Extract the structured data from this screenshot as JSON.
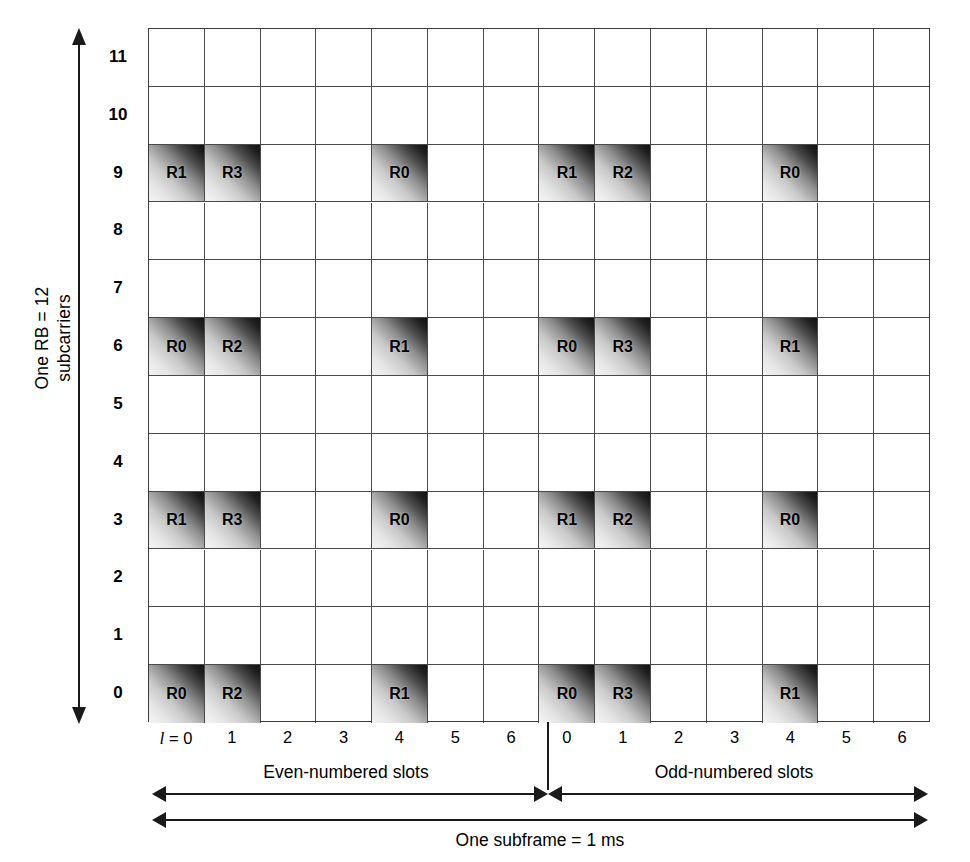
{
  "figure": {
    "y_axis_caption": "One RB = 12\nsubcarriers",
    "row_labels": [
      "11",
      "10",
      "9",
      "8",
      "7",
      "6",
      "5",
      "4",
      "3",
      "2",
      "1",
      "0"
    ],
    "symbol_labels": [
      "l = 0",
      "1",
      "2",
      "3",
      "4",
      "5",
      "6",
      "0",
      "1",
      "2",
      "3",
      "4",
      "5",
      "6"
    ],
    "symbol_label_prefix_var": "l",
    "symbol_label_prefix_rest": " = 0",
    "slot_captions": [
      "Even-numbered slots",
      "Odd-numbered slots"
    ],
    "subframe_caption": "One subframe = 1 ms",
    "colors": {
      "grid_line": "#4a4a4a",
      "grid_border": "#3a3a3a",
      "arrow": "#1a1a1a",
      "rs_light": "#f4f4f4",
      "rs_dark": "#111111",
      "background": "#ffffff"
    }
  },
  "chart_data": {
    "type": "heatmap",
    "title": "",
    "xlabel": "",
    "ylabel": "One RB = 12 subcarriers",
    "grid": true,
    "legend_position": "none",
    "rows": 12,
    "columns": 14,
    "row_labels": [
      "11",
      "10",
      "9",
      "8",
      "7",
      "6",
      "5",
      "4",
      "3",
      "2",
      "1",
      "0"
    ],
    "column_labels": [
      "0",
      "1",
      "2",
      "3",
      "4",
      "5",
      "6",
      "0",
      "1",
      "2",
      "3",
      "4",
      "5",
      "6"
    ],
    "row_order": "top-to-bottom subcarrier 11 down to 0",
    "slot_split_after_column_index": 6,
    "cells": [
      {
        "subcarrier": 11,
        "values": [
          "",
          "",
          "",
          "",
          "",
          "",
          "",
          "",
          "",
          "",
          "",
          "",
          "",
          ""
        ]
      },
      {
        "subcarrier": 10,
        "values": [
          "",
          "",
          "",
          "",
          "",
          "",
          "",
          "",
          "",
          "",
          "",
          "",
          "",
          ""
        ]
      },
      {
        "subcarrier": 9,
        "values": [
          "R1",
          "R3",
          "",
          "",
          "R0",
          "",
          "",
          "R1",
          "R2",
          "",
          "",
          "R0",
          "",
          ""
        ]
      },
      {
        "subcarrier": 8,
        "values": [
          "",
          "",
          "",
          "",
          "",
          "",
          "",
          "",
          "",
          "",
          "",
          "",
          "",
          ""
        ]
      },
      {
        "subcarrier": 7,
        "values": [
          "",
          "",
          "",
          "",
          "",
          "",
          "",
          "",
          "",
          "",
          "",
          "",
          "",
          ""
        ]
      },
      {
        "subcarrier": 6,
        "values": [
          "R0",
          "R2",
          "",
          "",
          "R1",
          "",
          "",
          "R0",
          "R3",
          "",
          "",
          "R1",
          "",
          ""
        ]
      },
      {
        "subcarrier": 5,
        "values": [
          "",
          "",
          "",
          "",
          "",
          "",
          "",
          "",
          "",
          "",
          "",
          "",
          "",
          ""
        ]
      },
      {
        "subcarrier": 4,
        "values": [
          "",
          "",
          "",
          "",
          "",
          "",
          "",
          "",
          "",
          "",
          "",
          "",
          "",
          ""
        ]
      },
      {
        "subcarrier": 3,
        "values": [
          "R1",
          "R3",
          "",
          "",
          "R0",
          "",
          "",
          "R1",
          "R2",
          "",
          "",
          "R0",
          "",
          ""
        ]
      },
      {
        "subcarrier": 2,
        "values": [
          "",
          "",
          "",
          "",
          "",
          "",
          "",
          "",
          "",
          "",
          "",
          "",
          "",
          ""
        ]
      },
      {
        "subcarrier": 1,
        "values": [
          "",
          "",
          "",
          "",
          "",
          "",
          "",
          "",
          "",
          "",
          "",
          "",
          "",
          ""
        ]
      },
      {
        "subcarrier": 0,
        "values": [
          "R0",
          "R2",
          "",
          "",
          "R1",
          "",
          "",
          "R0",
          "R3",
          "",
          "",
          "R1",
          "",
          ""
        ]
      }
    ],
    "annotations": [
      "Even-numbered slots",
      "Odd-numbered slots",
      "One subframe = 1 ms",
      "One RB = 12 subcarriers"
    ]
  }
}
